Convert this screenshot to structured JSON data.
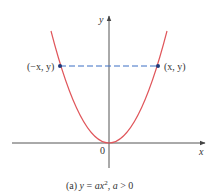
{
  "figure": {
    "caption": "(a) y = ax², a > 0",
    "caption_parts": {
      "prefix": "(a) ",
      "y": "y",
      "eq": " = ",
      "a": "a",
      "x": "x",
      "sup": "2",
      "sep": ", ",
      "a2": "a",
      "cond": " > 0"
    },
    "axes": {
      "x_label": "x",
      "y_label": "y",
      "origin_label": "0"
    },
    "points": [
      {
        "label": "(−x, y)"
      },
      {
        "label": "(x, y)"
      }
    ],
    "colors": {
      "curve": "#e0565b",
      "axis": "#555555",
      "dashed": "#3a6fc4",
      "point": "#1f3a7a"
    }
  }
}
